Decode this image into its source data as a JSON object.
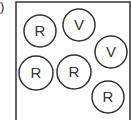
{
  "figure": {
    "label_fragment": ")",
    "box": {
      "x": 16,
      "y": 2,
      "width": 114,
      "height": 122,
      "stroke": "#333333"
    },
    "circles": [
      {
        "label": "R",
        "cx": 40,
        "cy": 31,
        "r": 16
      },
      {
        "label": "V",
        "cx": 79,
        "cy": 25,
        "r": 16
      },
      {
        "label": "V",
        "cx": 111,
        "cy": 52,
        "r": 16
      },
      {
        "label": "R",
        "cx": 36,
        "cy": 73,
        "r": 17
      },
      {
        "label": "R",
        "cx": 74,
        "cy": 72,
        "r": 17
      },
      {
        "label": "R",
        "cx": 108,
        "cy": 97,
        "r": 16
      }
    ]
  }
}
